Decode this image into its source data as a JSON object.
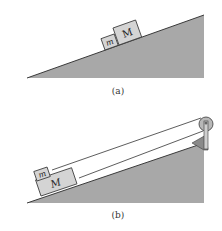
{
  "figure": {
    "panels": [
      {
        "id": "a",
        "caption": "(a)",
        "blocks": [
          {
            "label": "m",
            "style": "italic"
          },
          {
            "label": "M",
            "style": "normal"
          }
        ]
      },
      {
        "id": "b",
        "caption": "(b)",
        "blocks": [
          {
            "label": "m",
            "style": "italic"
          },
          {
            "label": "M",
            "style": "normal"
          }
        ],
        "has_pulley": true
      }
    ],
    "colors": {
      "incline_fill": "#a8a8a8",
      "incline_edge": "#3a3a3a",
      "block_fill": "#d4d4d4",
      "block_edge": "#3a3a3a",
      "pulley_fill": "#b8b8b8",
      "rope": "#333333"
    }
  }
}
